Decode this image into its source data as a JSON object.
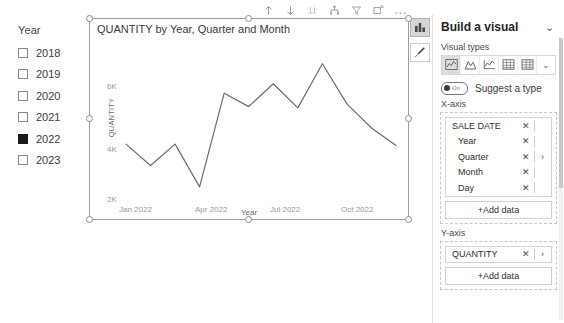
{
  "slicer": {
    "title": "Year",
    "items": [
      {
        "label": "2018",
        "checked": false
      },
      {
        "label": "2019",
        "checked": false
      },
      {
        "label": "2020",
        "checked": false
      },
      {
        "label": "2021",
        "checked": false
      },
      {
        "label": "2022",
        "checked": true
      },
      {
        "label": "2023",
        "checked": false
      }
    ]
  },
  "toolbar": {
    "icons": [
      {
        "name": "drill-up-icon",
        "glyph": "↑"
      },
      {
        "name": "drill-down-icon",
        "glyph": "↓"
      },
      {
        "name": "expand-all-icon",
        "glyph": "↓↓"
      },
      {
        "name": "drill-mode-icon",
        "glyph": "hierarchy"
      },
      {
        "name": "filter-icon",
        "glyph": "funnel"
      },
      {
        "name": "focus-mode-icon",
        "glyph": "focus"
      },
      {
        "name": "more-options-icon",
        "glyph": "…"
      }
    ]
  },
  "side_rail": {
    "buttons": [
      {
        "name": "build-visual-button",
        "icon": "bar-chart-icon",
        "active": true
      },
      {
        "name": "format-visual-button",
        "icon": "paintbrush-icon",
        "active": false
      }
    ]
  },
  "panel": {
    "title": "Build a visual",
    "collapse_glyph": "⌄",
    "visual_types_label": "Visual types",
    "visual_types": [
      {
        "name": "line-chart-type",
        "selected": true
      },
      {
        "name": "area-chart-type",
        "selected": false
      },
      {
        "name": "line-stacked-chart-type",
        "selected": false
      },
      {
        "name": "table-type",
        "selected": false
      },
      {
        "name": "matrix-type",
        "selected": false
      }
    ],
    "visual_types_more_glyph": "⌄",
    "suggest": {
      "label": "Suggest a type",
      "state": "On",
      "enabled": true
    },
    "x_axis": {
      "label": "X-axis",
      "fields": [
        "SALE DATE",
        "Year",
        "Quarter",
        "Month",
        "Day"
      ],
      "remove_glyph": "✕",
      "group_arrow_glyph": "›",
      "add_data_label": "+Add data"
    },
    "y_axis": {
      "label": "Y-axis",
      "fields": [
        "QUANTITY"
      ],
      "remove_glyph": "✕",
      "arrow_glyph": "›",
      "add_data_label": "+Add data"
    }
  },
  "chart_data": {
    "type": "line",
    "title": "QUANTITY by Year, Quarter and Month",
    "xlabel": "Year",
    "ylabel": "QUANTITY",
    "x": [
      "Jan 2022",
      "Feb 2022",
      "Mar 2022",
      "Apr 2022",
      "May 2022",
      "Jun 2022",
      "Jul 2022",
      "Aug 2022",
      "Sep 2022",
      "Oct 2022",
      "Nov 2022",
      "Dec 2022"
    ],
    "values": [
      4050,
      3250,
      4050,
      2450,
      5950,
      5450,
      6300,
      5400,
      7050,
      5550,
      4650,
      4000
    ],
    "ylim": [
      2000,
      7600
    ],
    "yticks": [
      2000,
      4000,
      6000
    ],
    "ytick_labels": [
      "2K",
      "4K",
      "6K"
    ],
    "xtick_labels": [
      "Jan 2022",
      "Apr 2022",
      "Jul 2022",
      "Oct 2022"
    ],
    "xtick_indices": [
      0,
      3,
      6,
      9
    ],
    "grid": false,
    "legend": "none",
    "line_color": "#6b6b6b"
  }
}
